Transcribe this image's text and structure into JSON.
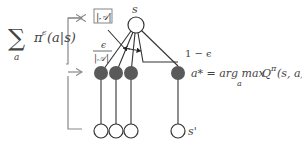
{
  "formula_left": {
    "sum_symbol": "∑",
    "sum_index": "a",
    "policy": "π",
    "policy_sup": "ϵ",
    "policy_args": "(a|s)"
  },
  "labels": {
    "state_top": "s",
    "state_next": "s'",
    "num_actions": "|𝒜|",
    "eps_num": "ϵ",
    "eps_den": "|𝒜|",
    "one_minus_eps": "1 − ϵ",
    "greedy_action": "a* = arg max",
    "greedy_sub": "a",
    "greedy_q": "Q",
    "greedy_q_sup": "π",
    "greedy_args": "(s, a)"
  },
  "colors": {
    "action_node": "#5a5a5a",
    "line": "#333333",
    "bracket": "#888888",
    "text": "#444444"
  },
  "nodes": {
    "state_top": {
      "cx": 136,
      "cy": 25,
      "r": 8
    },
    "actions": [
      {
        "cx": 101,
        "cy": 73
      },
      {
        "cx": 116,
        "cy": 73
      },
      {
        "cx": 131,
        "cy": 73
      },
      {
        "cx": 178,
        "cy": 73
      }
    ],
    "next_states": [
      {
        "cx": 101,
        "cy": 131
      },
      {
        "cx": 116,
        "cy": 131
      },
      {
        "cx": 131,
        "cy": 131
      },
      {
        "cx": 178,
        "cy": 131
      }
    ]
  }
}
